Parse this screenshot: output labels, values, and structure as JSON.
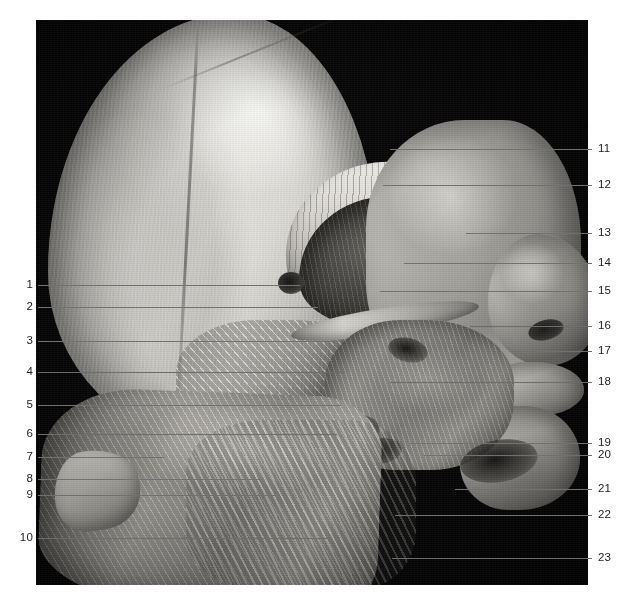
{
  "figure": {
    "type": "anatomical-dissection-photograph",
    "colors": {
      "page_background": "#ffffff",
      "photo_background": "#050505",
      "leader_line": "#6f6f6f",
      "label_text": "#1d1d1d"
    },
    "photo": {
      "x": 36,
      "y": 20,
      "width": 552,
      "height": 565
    }
  },
  "labels": {
    "left": [
      {
        "id": "1",
        "number": "1",
        "text_x": 33,
        "y": 285,
        "line_end_x": 300
      },
      {
        "id": "2",
        "number": "2",
        "text_x": 33,
        "y": 307,
        "line_end_x": 318
      },
      {
        "id": "3",
        "number": "3",
        "text_x": 33,
        "y": 341,
        "line_end_x": 334
      },
      {
        "id": "4",
        "number": "4",
        "text_x": 33,
        "y": 372,
        "line_end_x": 344
      },
      {
        "id": "5",
        "number": "5",
        "text_x": 33,
        "y": 405,
        "line_end_x": 341
      },
      {
        "id": "6",
        "number": "6",
        "text_x": 33,
        "y": 434,
        "line_end_x": 337
      },
      {
        "id": "7",
        "number": "7",
        "text_x": 33,
        "y": 457,
        "line_end_x": 164
      },
      {
        "id": "8",
        "number": "8",
        "text_x": 33,
        "y": 479,
        "line_end_x": 262
      },
      {
        "id": "9",
        "number": "9",
        "text_x": 33,
        "y": 495,
        "line_end_x": 276
      },
      {
        "id": "10",
        "number": "10",
        "text_x": 33,
        "y": 538,
        "line_end_x": 330
      }
    ],
    "right": [
      {
        "id": "11",
        "number": "11",
        "text_x": 598,
        "y": 149,
        "line_start_x": 390
      },
      {
        "id": "12",
        "number": "12",
        "text_x": 598,
        "y": 185,
        "line_start_x": 383
      },
      {
        "id": "13",
        "number": "13",
        "text_x": 598,
        "y": 233,
        "line_start_x": 466
      },
      {
        "id": "14",
        "number": "14",
        "text_x": 598,
        "y": 263,
        "line_start_x": 404
      },
      {
        "id": "15",
        "number": "15",
        "text_x": 598,
        "y": 291,
        "line_start_x": 380
      },
      {
        "id": "16",
        "number": "16",
        "text_x": 598,
        "y": 326,
        "line_start_x": 470
      },
      {
        "id": "17",
        "number": "17",
        "text_x": 598,
        "y": 351,
        "line_start_x": 512
      },
      {
        "id": "18",
        "number": "18",
        "text_x": 598,
        "y": 382,
        "line_start_x": 390
      },
      {
        "id": "19",
        "number": "19",
        "text_x": 598,
        "y": 443,
        "line_start_x": 410
      },
      {
        "id": "20",
        "number": "20",
        "text_x": 598,
        "y": 455,
        "line_start_x": 424
      },
      {
        "id": "21",
        "number": "21",
        "text_x": 598,
        "y": 489,
        "line_start_x": 455
      },
      {
        "id": "22",
        "number": "22",
        "text_x": 598,
        "y": 515,
        "line_start_x": 395
      },
      {
        "id": "23",
        "number": "23",
        "text_x": 598,
        "y": 558,
        "line_start_x": 392
      }
    ]
  }
}
